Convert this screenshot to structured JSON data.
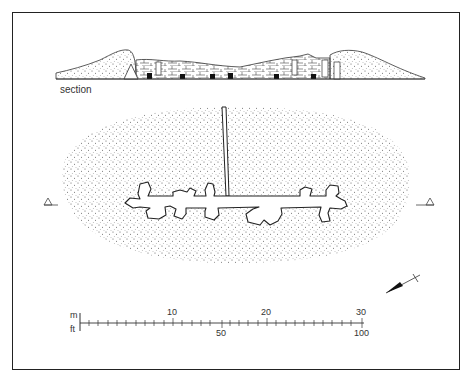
{
  "section": {
    "label": "section"
  },
  "scale": {
    "metres_label": "m",
    "feet_label": "ft",
    "metre_ticks": [
      "10",
      "20",
      "30"
    ],
    "feet_ticks": [
      "50",
      "100"
    ]
  },
  "markers": {
    "left": "section-marker-left",
    "right": "section-marker-right"
  },
  "colors": {
    "ink": "#222222",
    "stipple": "#555555",
    "background": "#ffffff"
  }
}
